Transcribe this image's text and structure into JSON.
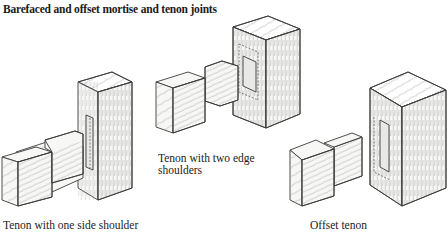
{
  "figure": {
    "title": "Barefaced and offset mortise and tenon joints",
    "captions": [
      "Tenon with one side shoulder",
      "Tenon with two edge shoulders",
      "Offset tenon"
    ],
    "caption_line_split": {
      "two_edge_line1": "Tenon with two edge",
      "two_edge_line2": "shoulders"
    }
  }
}
